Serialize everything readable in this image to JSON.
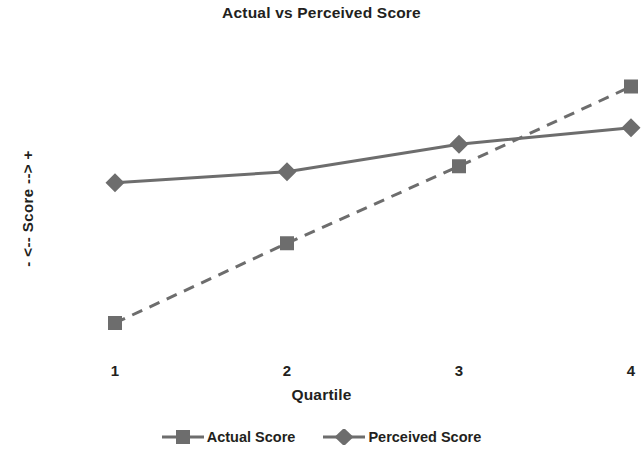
{
  "chart_data": {
    "type": "line",
    "title": "Actual vs Perceived Score",
    "xlabel": "Quartile",
    "ylabel": "-  <-- Score -->  +",
    "categories": [
      "1",
      "2",
      "3",
      "4"
    ],
    "series": [
      {
        "name": "Actual Score",
        "marker": "square",
        "linestyle": "dashed",
        "color": "#6d6d6d",
        "values": [
          8,
          37,
          65,
          94
        ]
      },
      {
        "name": "Perceived Score",
        "marker": "diamond",
        "linestyle": "solid",
        "color": "#6d6d6d",
        "values": [
          59,
          63,
          73,
          79
        ]
      }
    ],
    "ylim": [
      0,
      100
    ],
    "y_ticks_visible": false,
    "grid": false,
    "legend_position": "bottom",
    "axes_visible": false
  },
  "legend": {
    "items": [
      {
        "label": "Actual Score",
        "marker_icon": "square-marker-icon"
      },
      {
        "label": "Perceived Score",
        "marker_icon": "diamond-marker-icon"
      }
    ]
  }
}
